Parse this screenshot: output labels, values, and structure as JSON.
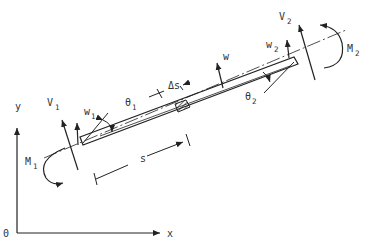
{
  "diagram": {
    "type": "beam-element-free-body",
    "axes": {
      "origin": "0",
      "x": "x",
      "y": "y"
    },
    "labels": {
      "V1": "V",
      "V1_sub": "1",
      "V2": "V",
      "V2_sub": "2",
      "M1": "M",
      "M1_sub": "1",
      "M2": "M",
      "M2_sub": "2",
      "w1": "w",
      "w1_sub": "1",
      "w2": "w",
      "w2_sub": "2",
      "w": "w",
      "theta1": "θ",
      "theta1_sub": "1",
      "theta2": "θ",
      "theta2_sub": "2",
      "ds": "Δs",
      "s": "s"
    },
    "colors": {
      "ink": "#222222",
      "background": "#ffffff"
    }
  }
}
